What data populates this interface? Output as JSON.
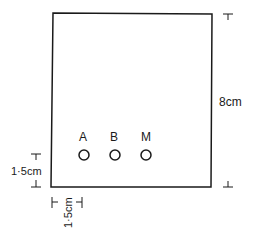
{
  "diagram": {
    "type": "chromatography-paper",
    "height_label": "8cm",
    "baseline_label": "1·5cm",
    "margin_label": "1·5cm",
    "spots": [
      {
        "label": "A"
      },
      {
        "label": "B"
      },
      {
        "label": "M"
      }
    ],
    "colors": {
      "line": "#1a1a1a",
      "background": "#ffffff"
    }
  }
}
